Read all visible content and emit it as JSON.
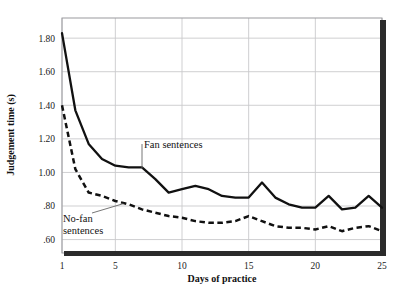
{
  "chart_data": {
    "type": "line",
    "title": "",
    "subtitle": "",
    "xlabel": "Days of practice",
    "ylabel": "Judgement time (s)",
    "xlim": [
      1,
      25
    ],
    "ylim": [
      0.52,
      1.92
    ],
    "grid": true,
    "legend_position": "inline-annotations",
    "x_ticks": [
      "1",
      "5",
      "10",
      "15",
      "20",
      "25"
    ],
    "x_tick_values": [
      1,
      5,
      10,
      15,
      20,
      25
    ],
    "y_ticks": [
      "1.80",
      "1.60",
      "1.40",
      "1.20",
      "1.00",
      ".80",
      ".60"
    ],
    "y_tick_values": [
      1.8,
      1.6,
      1.4,
      1.2,
      1.0,
      0.8,
      0.6
    ],
    "x": [
      1,
      2,
      3,
      4,
      5,
      6,
      7,
      8,
      9,
      10,
      11,
      12,
      13,
      14,
      15,
      16,
      17,
      18,
      19,
      20,
      21,
      22,
      23,
      24,
      25
    ],
    "series": [
      {
        "name": "Fan sentences",
        "style": "solid",
        "color": "#111111",
        "values": [
          1.83,
          1.37,
          1.17,
          1.08,
          1.04,
          1.03,
          1.03,
          0.96,
          0.88,
          0.9,
          0.92,
          0.9,
          0.86,
          0.85,
          0.85,
          0.94,
          0.85,
          0.81,
          0.79,
          0.79,
          0.86,
          0.78,
          0.79,
          0.86,
          0.79
        ]
      },
      {
        "name": "No-fan sentences",
        "style": "dashed",
        "color": "#111111",
        "values": [
          1.4,
          1.02,
          0.88,
          0.86,
          0.83,
          0.81,
          0.78,
          0.76,
          0.74,
          0.73,
          0.71,
          0.7,
          0.7,
          0.71,
          0.74,
          0.71,
          0.68,
          0.67,
          0.67,
          0.66,
          0.68,
          0.65,
          0.67,
          0.68,
          0.65
        ]
      }
    ],
    "annotations": [
      {
        "label": "Fan sentences",
        "target_x": 7,
        "target_y": 1.03
      },
      {
        "label": "No-fan sentences",
        "label_line_1": "No-fan",
        "label_line_2": "sentences",
        "target_x": 5.6,
        "target_y": 0.82
      }
    ]
  },
  "axes": {
    "y_title": "Judgement time (s)",
    "x_title": "Days of practice"
  },
  "annotations": {
    "fan": "Fan sentences",
    "nofan_line1": "No-fan",
    "nofan_line2": "sentences"
  },
  "colors": {
    "line": "#111111",
    "grid": "#c9c9cc",
    "frame": "#9a9a9e",
    "shadow": "#2b2b2b",
    "background": "#ffffff",
    "text": "#111111"
  }
}
